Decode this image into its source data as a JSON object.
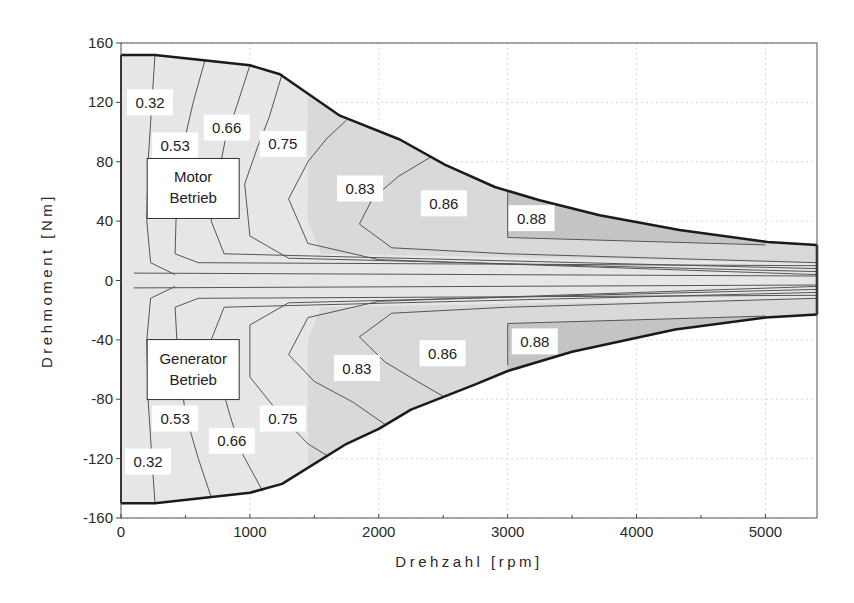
{
  "chart_data": {
    "type": "contour",
    "title": "",
    "xlabel": "Drehzahl [rpm]",
    "ylabel": "Drehmoment [Nm]",
    "xlim": [
      0,
      5400
    ],
    "ylim": [
      -160,
      160
    ],
    "xticks": [
      0,
      1000,
      2000,
      3000,
      4000,
      5000
    ],
    "xtick_labels": [
      "0",
      "1000",
      "2000",
      "3000",
      "4000",
      "5000"
    ],
    "yticks": [
      160,
      120,
      80,
      40,
      0,
      -40,
      -80,
      -120,
      -160
    ],
    "ytick_labels": [
      "160",
      "120",
      "80",
      "40",
      "0",
      "-40",
      "-80",
      "-120",
      "-160"
    ],
    "grid": true,
    "colors": {
      "background": "#ffffff",
      "region_light": "#e6e6e6",
      "region_mid": "#d9d9d9",
      "region_dark": "#c4c4c4",
      "boundary": "#1a1a1a",
      "contour_line": "#555555",
      "grid": "#d8d8d8"
    },
    "boundary_upper": [
      [
        0,
        152
      ],
      [
        264,
        152
      ],
      [
        1000,
        145
      ],
      [
        1233,
        139
      ],
      [
        1698,
        111
      ],
      [
        2163,
        95
      ],
      [
        2512,
        78
      ],
      [
        2900,
        63
      ],
      [
        3248,
        54
      ],
      [
        3713,
        44
      ],
      [
        4333,
        34
      ],
      [
        5016,
        26
      ],
      [
        5400,
        24
      ]
    ],
    "boundary_lower": [
      [
        0,
        -150
      ],
      [
        264,
        -150
      ],
      [
        1000,
        -143
      ],
      [
        1250,
        -137
      ],
      [
        1750,
        -110
      ],
      [
        2000,
        -100
      ],
      [
        2250,
        -87
      ],
      [
        2750,
        -70
      ],
      [
        3000,
        -61
      ],
      [
        3500,
        -48
      ],
      [
        4300,
        -33
      ],
      [
        5000,
        -25
      ],
      [
        5400,
        -23
      ]
    ],
    "contour_levels": [
      0.32,
      0.53,
      0.66,
      0.75,
      0.83,
      0.86,
      0.88
    ],
    "contour_labels": [
      {
        "text": "0.32",
        "x": 225,
        "y": 120
      },
      {
        "text": "0.53",
        "x": 420,
        "y": 91
      },
      {
        "text": "0.66",
        "x": 820,
        "y": 103
      },
      {
        "text": "0.75",
        "x": 1255,
        "y": 92
      },
      {
        "text": "0.83",
        "x": 1855,
        "y": 62
      },
      {
        "text": "0.86",
        "x": 2505,
        "y": 52
      },
      {
        "text": "0.88",
        "x": 3185,
        "y": 42
      },
      {
        "text": "0.32",
        "x": 210,
        "y": -122
      },
      {
        "text": "0.53",
        "x": 420,
        "y": -93
      },
      {
        "text": "0.66",
        "x": 860,
        "y": -108
      },
      {
        "text": "0.75",
        "x": 1255,
        "y": -93
      },
      {
        "text": "0.83",
        "x": 1830,
        "y": -59
      },
      {
        "text": "0.86",
        "x": 2495,
        "y": -49
      },
      {
        "text": "0.88",
        "x": 3210,
        "y": -41
      }
    ],
    "region_labels": [
      {
        "lines": [
          "Motor",
          "Betrieb"
        ],
        "x": 560,
        "y": 62
      },
      {
        "lines": [
          "Generator",
          "Betrieb"
        ],
        "x": 560,
        "y": -60
      }
    ]
  }
}
